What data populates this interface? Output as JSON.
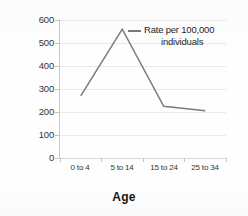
{
  "chart_data": {
    "type": "line",
    "title": "",
    "xlabel": "Age",
    "ylabel": "",
    "categories": [
      "0 to 4",
      "5 to 14",
      "15 to 24",
      "25 to 34"
    ],
    "series": [
      {
        "name": "Rate per 100,000 individuals",
        "values": [
          270,
          560,
          225,
          205
        ],
        "color": "#7a7a7a"
      }
    ],
    "ylim": [
      0,
      600
    ],
    "yticks": [
      0,
      100,
      200,
      300,
      400,
      500,
      600
    ],
    "ytick_labels": [
      "0",
      "100",
      "200",
      "300",
      "400",
      "500",
      "600"
    ],
    "grid": true,
    "legend_position": "inside-top-right",
    "legend_entries": [
      {
        "label_line1": "Rate per 100,000",
        "label_line2": "individuals"
      }
    ]
  },
  "colors": {
    "series_line": "#7a7a7a",
    "gridline": "#e9e9e9",
    "axis": "#c9c9c9",
    "text": "#2b2b2b",
    "background": "#fefefe"
  }
}
